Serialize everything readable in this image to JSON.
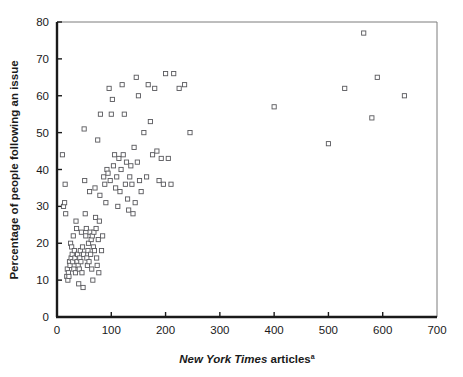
{
  "chart_data": {
    "type": "scatter",
    "title": "",
    "xlabel": "New York Times articles",
    "xlabel_italic_part": "New York Times",
    "xlabel_plain_part": " articles",
    "xlabel_superscript": "a",
    "ylabel": "Percentage of people following an issue",
    "xlim": [
      0,
      700
    ],
    "ylim": [
      0,
      80
    ],
    "xticks": [
      0,
      100,
      200,
      300,
      400,
      500,
      600,
      700
    ],
    "yticks": [
      0,
      10,
      20,
      30,
      40,
      50,
      60,
      70,
      80
    ],
    "xtick_labels": [
      "0",
      "100",
      "200",
      "300",
      "400",
      "500",
      "600",
      "700"
    ],
    "ytick_labels": [
      "0",
      "10",
      "20",
      "30",
      "40",
      "50",
      "60",
      "70",
      "80"
    ],
    "grid": false,
    "legend": null,
    "marker_style": "open-square",
    "marker_color": "#58585c",
    "points": [
      [
        10,
        44
      ],
      [
        12,
        30
      ],
      [
        14,
        31
      ],
      [
        15,
        36
      ],
      [
        16,
        28
      ],
      [
        18,
        11
      ],
      [
        19,
        13
      ],
      [
        20,
        10
      ],
      [
        21,
        12
      ],
      [
        22,
        11
      ],
      [
        23,
        15
      ],
      [
        24,
        14
      ],
      [
        25,
        20
      ],
      [
        26,
        16
      ],
      [
        27,
        19
      ],
      [
        28,
        17
      ],
      [
        29,
        15
      ],
      [
        30,
        22
      ],
      [
        31,
        13
      ],
      [
        32,
        18
      ],
      [
        33,
        16
      ],
      [
        34,
        12
      ],
      [
        35,
        26
      ],
      [
        36,
        24
      ],
      [
        37,
        15
      ],
      [
        38,
        17
      ],
      [
        39,
        14
      ],
      [
        40,
        9
      ],
      [
        41,
        13
      ],
      [
        42,
        16
      ],
      [
        43,
        18
      ],
      [
        44,
        15
      ],
      [
        45,
        23
      ],
      [
        46,
        12
      ],
      [
        47,
        19
      ],
      [
        48,
        8
      ],
      [
        49,
        17
      ],
      [
        50,
        51
      ],
      [
        51,
        37
      ],
      [
        52,
        28
      ],
      [
        53,
        22
      ],
      [
        54,
        24
      ],
      [
        55,
        16
      ],
      [
        56,
        14
      ],
      [
        57,
        18
      ],
      [
        58,
        20
      ],
      [
        59,
        15
      ],
      [
        60,
        34
      ],
      [
        61,
        23
      ],
      [
        62,
        17
      ],
      [
        63,
        21
      ],
      [
        64,
        13
      ],
      [
        65,
        22
      ],
      [
        66,
        10
      ],
      [
        67,
        19
      ],
      [
        68,
        23
      ],
      [
        69,
        18
      ],
      [
        70,
        35
      ],
      [
        71,
        27
      ],
      [
        72,
        24
      ],
      [
        73,
        16
      ],
      [
        74,
        14
      ],
      [
        75,
        48
      ],
      [
        76,
        21
      ],
      [
        77,
        12
      ],
      [
        78,
        26
      ],
      [
        79,
        33
      ],
      [
        80,
        55
      ],
      [
        82,
        18
      ],
      [
        84,
        22
      ],
      [
        86,
        38
      ],
      [
        88,
        36
      ],
      [
        90,
        31
      ],
      [
        92,
        40
      ],
      [
        94,
        39
      ],
      [
        96,
        62
      ],
      [
        98,
        37
      ],
      [
        100,
        55
      ],
      [
        102,
        59
      ],
      [
        104,
        41
      ],
      [
        106,
        44
      ],
      [
        108,
        35
      ],
      [
        110,
        38
      ],
      [
        112,
        30
      ],
      [
        114,
        43
      ],
      [
        116,
        34
      ],
      [
        118,
        40
      ],
      [
        120,
        63
      ],
      [
        122,
        44
      ],
      [
        124,
        55
      ],
      [
        126,
        36
      ],
      [
        128,
        42
      ],
      [
        130,
        32
      ],
      [
        132,
        29
      ],
      [
        134,
        38
      ],
      [
        136,
        41
      ],
      [
        138,
        36
      ],
      [
        140,
        28
      ],
      [
        142,
        46
      ],
      [
        144,
        31
      ],
      [
        146,
        65
      ],
      [
        148,
        42
      ],
      [
        150,
        60
      ],
      [
        152,
        37
      ],
      [
        155,
        34
      ],
      [
        160,
        50
      ],
      [
        165,
        38
      ],
      [
        168,
        63
      ],
      [
        172,
        53
      ],
      [
        176,
        44
      ],
      [
        180,
        62
      ],
      [
        184,
        45
      ],
      [
        188,
        37
      ],
      [
        192,
        43
      ],
      [
        196,
        36
      ],
      [
        200,
        66
      ],
      [
        205,
        43
      ],
      [
        210,
        36
      ],
      [
        215,
        66
      ],
      [
        225,
        62
      ],
      [
        235,
        63
      ],
      [
        245,
        50
      ],
      [
        400,
        57
      ],
      [
        500,
        47
      ],
      [
        530,
        62
      ],
      [
        565,
        77
      ],
      [
        580,
        54
      ],
      [
        590,
        65
      ],
      [
        640,
        60
      ]
    ]
  }
}
